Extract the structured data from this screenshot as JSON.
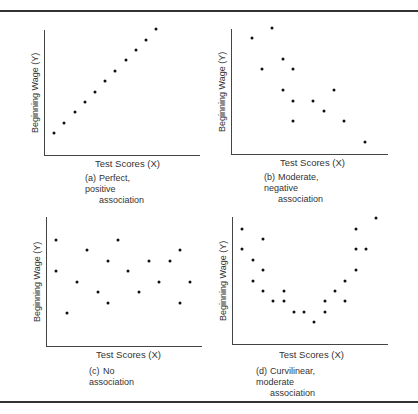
{
  "figure": {
    "panels": [
      {
        "id": "a",
        "tag": "(a)",
        "caption_line1": "Perfect, positive",
        "caption_line2": "association",
        "xlabel": "Test Scores (X)",
        "ylabel": "Beginning Wage (Y)"
      },
      {
        "id": "b",
        "tag": "(b)",
        "caption_line1": "Moderate, negative",
        "caption_line2": "association",
        "xlabel": "Test Scores (X)",
        "ylabel": "Beginning Wage (Y)"
      },
      {
        "id": "c",
        "tag": "(c)",
        "caption_line1": "No association",
        "caption_line2": "",
        "xlabel": "Test Scores (X)",
        "ylabel": "Beginning Wage (Y)"
      },
      {
        "id": "d",
        "tag": "(d)",
        "caption_line1": "Curvilinear, moderate",
        "caption_line2": "association",
        "xlabel": "Test Scores (X)",
        "ylabel": "Beginning Wage (Y)"
      }
    ]
  },
  "chart_data": [
    {
      "type": "scatter",
      "title": "(a) Perfect, positive association",
      "xlabel": "Test Scores (X)",
      "ylabel": "Beginning Wage (Y)",
      "grid": false,
      "ticks": false,
      "xlim": [
        0,
        16
      ],
      "ylim": [
        0,
        13
      ],
      "points": [
        [
          1,
          2
        ],
        [
          2,
          3
        ],
        [
          3,
          4
        ],
        [
          4,
          5
        ],
        [
          5,
          6
        ],
        [
          6,
          7
        ],
        [
          7,
          8
        ],
        [
          8,
          9
        ],
        [
          9,
          10
        ],
        [
          10,
          11
        ],
        [
          11,
          12
        ]
      ]
    },
    {
      "type": "scatter",
      "title": "(b) Moderate, negative association",
      "xlabel": "Test Scores (X)",
      "ylabel": "Beginning Wage (Y)",
      "grid": false,
      "ticks": false,
      "xlim": [
        0,
        16
      ],
      "ylim": [
        0,
        13
      ],
      "points": [
        [
          2,
          11
        ],
        [
          3,
          8
        ],
        [
          4,
          12
        ],
        [
          5,
          9
        ],
        [
          5,
          6
        ],
        [
          6,
          8
        ],
        [
          6,
          5
        ],
        [
          6,
          3
        ],
        [
          8,
          5
        ],
        [
          9,
          4
        ],
        [
          10,
          6
        ],
        [
          11,
          3
        ],
        [
          13,
          1
        ]
      ]
    },
    {
      "type": "scatter",
      "title": "(c) No association",
      "xlabel": "Test Scores (X)",
      "ylabel": "Beginning Wage (Y)",
      "grid": false,
      "ticks": false,
      "xlim": [
        0,
        16
      ],
      "ylim": [
        0,
        13
      ],
      "points": [
        [
          1,
          10
        ],
        [
          1,
          7
        ],
        [
          2,
          3
        ],
        [
          3,
          6
        ],
        [
          4,
          9
        ],
        [
          5,
          5
        ],
        [
          6,
          8
        ],
        [
          6,
          4
        ],
        [
          7,
          10
        ],
        [
          8,
          7
        ],
        [
          9,
          5
        ],
        [
          10,
          8
        ],
        [
          11,
          6
        ],
        [
          12,
          8
        ],
        [
          13,
          9
        ],
        [
          13,
          4
        ],
        [
          14,
          6
        ]
      ]
    },
    {
      "type": "scatter",
      "title": "(d) Curvilinear, moderate association",
      "xlabel": "Test Scores (X)",
      "ylabel": "Beginning Wage (Y)",
      "grid": false,
      "ticks": false,
      "xlim": [
        0,
        16
      ],
      "ylim": [
        0,
        13
      ],
      "points": [
        [
          1,
          11
        ],
        [
          1,
          9
        ],
        [
          2,
          8
        ],
        [
          2,
          6
        ],
        [
          3,
          10
        ],
        [
          3,
          7
        ],
        [
          3,
          5
        ],
        [
          4,
          4
        ],
        [
          5,
          5
        ],
        [
          5,
          4
        ],
        [
          6,
          3
        ],
        [
          7,
          3
        ],
        [
          8,
          2
        ],
        [
          9,
          4
        ],
        [
          9,
          3
        ],
        [
          10,
          5
        ],
        [
          11,
          4
        ],
        [
          11,
          6
        ],
        [
          12,
          11
        ],
        [
          12,
          9
        ],
        [
          12,
          7
        ],
        [
          13,
          9
        ],
        [
          14,
          12
        ]
      ]
    }
  ],
  "layout": {
    "panels": [
      {
        "axis_left": 44,
        "axis_top": 30,
        "axis_bottom": 155,
        "axis_right": 200,
        "x0": 44,
        "dx": 10.2,
        "y0": 154,
        "dy": 10.4,
        "xlabel_pos": [
          95,
          158
        ],
        "caption_pos": [
          85,
          173
        ]
      },
      {
        "axis_left": 231,
        "axis_top": 29,
        "axis_bottom": 154,
        "axis_right": 388,
        "x0": 231,
        "dx": 10.3,
        "y0": 152.5,
        "dy": 10.4,
        "xlabel_pos": [
          280,
          157
        ],
        "caption_pos": [
          264,
          172
        ]
      },
      {
        "axis_left": 46,
        "axis_top": 217,
        "axis_bottom": 346,
        "axis_right": 202,
        "x0": 46,
        "dx": 10.3,
        "y0": 344.5,
        "dy": 10.5,
        "xlabel_pos": [
          96,
          349
        ],
        "caption_pos": [
          89,
          366
        ]
      },
      {
        "axis_left": 232,
        "axis_top": 217,
        "axis_bottom": 344,
        "axis_right": 388,
        "x0": 232,
        "dx": 10.3,
        "y0": 343,
        "dy": 10.4,
        "xlabel_pos": [
          279,
          349
        ],
        "caption_pos": [
          256,
          366
        ]
      }
    ]
  }
}
